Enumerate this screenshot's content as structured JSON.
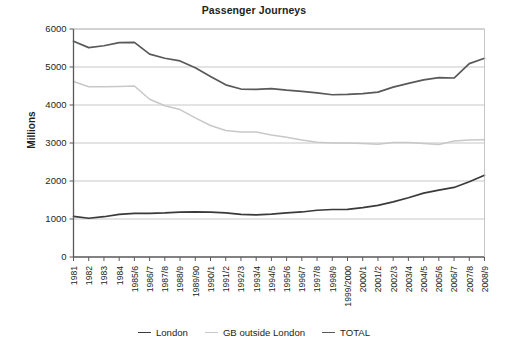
{
  "chart_data": {
    "type": "line",
    "title": "Passenger Journeys",
    "xlabel": "",
    "ylabel": "Millions",
    "ylim": [
      0,
      6000
    ],
    "yticks": [
      0,
      1000,
      2000,
      3000,
      4000,
      5000,
      6000
    ],
    "ytick_labels": [
      "0",
      "1000",
      "2000",
      "3000",
      "4000",
      "5000",
      "6000"
    ],
    "grid": "horizontal",
    "legend_position": "bottom-center",
    "categories": [
      "1981",
      "1982",
      "1983",
      "1984",
      "1985/6",
      "1986/7",
      "1987/8",
      "1988/9",
      "1989/90",
      "1990/1",
      "1991/2",
      "1992/3",
      "1993/4",
      "1994/5",
      "1995/6",
      "1996/7",
      "1997/8",
      "1998/9",
      "1999/2000",
      "2000/1",
      "2001/2",
      "2002/3",
      "2003/4",
      "2004/5",
      "2005/6",
      "2006/7",
      "2007/8",
      "2008/9"
    ],
    "series": [
      {
        "name": "London",
        "color": "#3a3a3a",
        "values": [
          1070,
          1020,
          1060,
          1120,
          1150,
          1150,
          1160,
          1180,
          1185,
          1180,
          1160,
          1120,
          1110,
          1130,
          1160,
          1185,
          1230,
          1250,
          1255,
          1300,
          1360,
          1450,
          1560,
          1680,
          1760,
          1830,
          1980,
          2150
        ]
      },
      {
        "name": "GB outside London",
        "color": "#c8c8c8",
        "values": [
          4620,
          4480,
          4480,
          4490,
          4500,
          4150,
          3980,
          3880,
          3660,
          3460,
          3330,
          3290,
          3290,
          3210,
          3150,
          3080,
          3020,
          3000,
          3000,
          2990,
          2970,
          3010,
          3010,
          2990,
          2960,
          3050,
          3080,
          3085
        ]
      },
      {
        "name": "TOTAL",
        "color": "#58595b",
        "values": [
          5680,
          5510,
          5560,
          5640,
          5650,
          5340,
          5230,
          5160,
          4980,
          4750,
          4530,
          4420,
          4410,
          4430,
          4390,
          4360,
          4320,
          4270,
          4280,
          4300,
          4340,
          4470,
          4570,
          4660,
          4720,
          4710,
          5090,
          5230
        ]
      }
    ]
  },
  "legend": {
    "items": [
      {
        "label": "London"
      },
      {
        "label": "GB outside London"
      },
      {
        "label": "TOTAL"
      }
    ]
  }
}
